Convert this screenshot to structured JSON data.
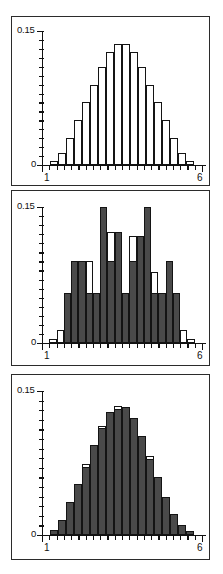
{
  "figure": {
    "panel_count": 3,
    "bin_count": 22,
    "colors": {
      "outline": "#141414",
      "fill_dark": "#4a4a4a",
      "fill_white": "#ffffff",
      "frame": "#2b2b2b",
      "axis": "#111111"
    }
  },
  "chart_data": [
    {
      "type": "bar",
      "title": "",
      "xlabel": "",
      "ylabel": "",
      "panel": "top",
      "grid": false,
      "legend": null,
      "xlim": [
        1,
        6
      ],
      "ylim": [
        0,
        0.15
      ],
      "y_ticks_major": [
        "0",
        "0.15"
      ],
      "y_minor_tick_count": 14,
      "x_ticks_major": [
        "1",
        "6"
      ],
      "x_minor_tick_count": 22,
      "axis_labels": {
        "y_top": "0.15",
        "y_bottom": "0",
        "x_left": "1",
        "x_right": "6"
      },
      "series": [
        {
          "name": "white",
          "style": "outline",
          "values": [
            0.004,
            0.014,
            0.03,
            0.05,
            0.07,
            0.09,
            0.11,
            0.126,
            0.135,
            0.135,
            0.126,
            0.11,
            0.09,
            0.07,
            0.05,
            0.03,
            0.014,
            0.004
          ]
        }
      ],
      "categories": [
        "1.0",
        "1.2",
        "1.4",
        "1.6",
        "1.8",
        "2.0",
        "2.2",
        "2.4",
        "2.6",
        "2.8",
        "3.0",
        "3.2",
        "3.4",
        "3.6",
        "3.8",
        "4.0",
        "4.2",
        "4.4"
      ]
    },
    {
      "type": "bar",
      "title": "",
      "xlabel": "",
      "ylabel": "",
      "panel": "middle",
      "grid": false,
      "legend": null,
      "xlim": [
        1,
        6
      ],
      "ylim": [
        0,
        0.15
      ],
      "y_ticks_major": [
        "0",
        "0.15"
      ],
      "y_minor_tick_count": 14,
      "x_ticks_major": [
        "1",
        "6"
      ],
      "x_minor_tick_count": 22,
      "axis_labels": {
        "y_top": "0.15",
        "y_bottom": "0",
        "x_left": "1",
        "x_right": "6"
      },
      "series": [
        {
          "name": "white",
          "style": "outline",
          "values": [
            0.004,
            0.014,
            0.055,
            0.09,
            0.09,
            0.09,
            0.055,
            0.15,
            0.122,
            0.122,
            0.055,
            0.118,
            0.118,
            0.15,
            0.078,
            0.055,
            0.09,
            0.055,
            0.014,
            0.004
          ]
        },
        {
          "name": "dark",
          "style": "filled",
          "values": [
            0.0,
            0.0,
            0.055,
            0.09,
            0.09,
            0.055,
            0.055,
            0.15,
            0.09,
            0.122,
            0.055,
            0.09,
            0.118,
            0.15,
            0.055,
            0.055,
            0.09,
            0.055,
            0.0,
            0.0
          ]
        }
      ],
      "categories": [
        "1.0",
        "1.2",
        "1.4",
        "1.6",
        "1.8",
        "2.0",
        "2.2",
        "2.4",
        "2.6",
        "2.8",
        "3.0",
        "3.2",
        "3.4",
        "3.6",
        "3.8",
        "4.0",
        "4.2",
        "4.4",
        "4.6",
        "4.8"
      ]
    },
    {
      "type": "bar",
      "title": "",
      "xlabel": "",
      "ylabel": "",
      "panel": "bottom",
      "grid": false,
      "legend": null,
      "xlim": [
        1,
        6
      ],
      "ylim": [
        0,
        0.15
      ],
      "y_ticks_major": [
        "0",
        "0.15"
      ],
      "y_minor_tick_count": 14,
      "x_ticks_major": [
        "1",
        "6"
      ],
      "x_minor_tick_count": 22,
      "axis_labels": {
        "y_top": "0.15",
        "y_bottom": "0",
        "x_left": "1",
        "x_right": "6"
      },
      "series": [
        {
          "name": "white",
          "style": "outline",
          "values": [
            0.005,
            0.016,
            0.034,
            0.053,
            0.074,
            0.094,
            0.114,
            0.128,
            0.134,
            0.133,
            0.122,
            0.103,
            0.082,
            0.06,
            0.04,
            0.022,
            0.01,
            0.004
          ]
        },
        {
          "name": "dark",
          "style": "filled",
          "values": [
            0.005,
            0.016,
            0.034,
            0.053,
            0.071,
            0.094,
            0.111,
            0.128,
            0.131,
            0.133,
            0.122,
            0.103,
            0.079,
            0.06,
            0.04,
            0.022,
            0.01,
            0.004
          ]
        }
      ],
      "categories": [
        "1.0",
        "1.2",
        "1.4",
        "1.6",
        "1.8",
        "2.0",
        "2.2",
        "2.4",
        "2.6",
        "2.8",
        "3.0",
        "3.2",
        "3.4",
        "3.6",
        "3.8",
        "4.0",
        "4.2",
        "4.4"
      ]
    }
  ]
}
